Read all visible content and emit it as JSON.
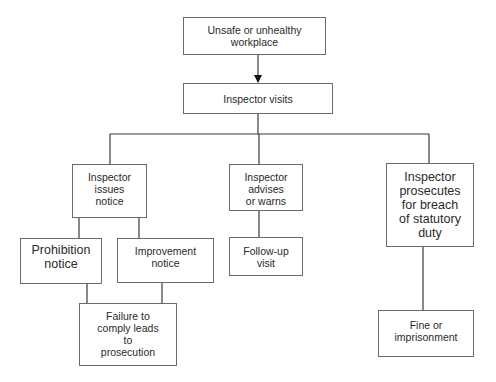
{
  "diagram": {
    "type": "flowchart",
    "nodes": {
      "unsafe_workplace": {
        "label": "Unsafe or unhealthy\nworkplace"
      },
      "inspector_visits": {
        "label": "Inspector visits"
      },
      "issues_notice": {
        "label": "Inspector\nissues\nnotice"
      },
      "advises_warns": {
        "label": "Inspector\nadvises\nor warns"
      },
      "prosecutes": {
        "label": "Inspector\nprosecutes\nfor breach\nof statutory\nduty"
      },
      "prohibition_notice": {
        "label": "Prohibition\nnotice"
      },
      "improvement_notice": {
        "label": "Improvement\nnotice"
      },
      "follow_up_visit": {
        "label": "Follow-up\nvisit"
      },
      "failure_to_comply": {
        "label": "Failure to\ncomply leads\nto\nprosecution"
      },
      "fine_imprisonment": {
        "label": "Fine or\nimprisonment"
      }
    },
    "edges": [
      {
        "from": "unsafe_workplace",
        "to": "inspector_visits",
        "arrow": true
      },
      {
        "from": "inspector_visits",
        "to": "issues_notice",
        "arrow": false
      },
      {
        "from": "inspector_visits",
        "to": "advises_warns",
        "arrow": false
      },
      {
        "from": "inspector_visits",
        "to": "prosecutes",
        "arrow": false
      },
      {
        "from": "issues_notice",
        "to": "prohibition_notice",
        "arrow": false
      },
      {
        "from": "issues_notice",
        "to": "improvement_notice",
        "arrow": false
      },
      {
        "from": "advises_warns",
        "to": "follow_up_visit",
        "arrow": false
      },
      {
        "from": "prohibition_notice",
        "to": "failure_to_comply",
        "arrow": false
      },
      {
        "from": "improvement_notice",
        "to": "failure_to_comply",
        "arrow": false
      },
      {
        "from": "prosecutes",
        "to": "fine_imprisonment",
        "arrow": false
      }
    ],
    "colors": {
      "border": "#6a6a6a",
      "line": "#3a3a3a",
      "background": "#ffffff",
      "text": "#2a2a2a"
    }
  }
}
